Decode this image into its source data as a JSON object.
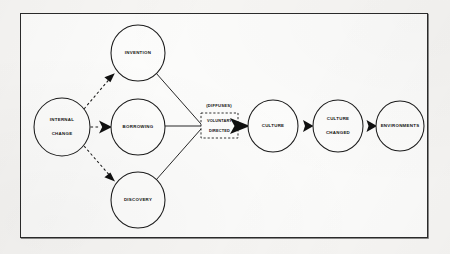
{
  "diagram": {
    "frame": {
      "border_color": "#2b2b2b",
      "background": "#fcfcfb"
    },
    "page_background": "#f7f6f4",
    "nodes": [
      {
        "id": "internal-change",
        "label_line1": "INTERNAL",
        "label_line2": "CHANGE",
        "cx": 62,
        "cy": 127,
        "rx": 28,
        "ry": 29
      },
      {
        "id": "invention",
        "label_line1": "INVENTION",
        "label_line2": "",
        "cx": 138,
        "cy": 53,
        "rx": 27,
        "ry": 28
      },
      {
        "id": "borrowing",
        "label_line1": "BORROWING",
        "label_line2": "",
        "cx": 138,
        "cy": 127,
        "rx": 27,
        "ry": 28
      },
      {
        "id": "discovery",
        "label_line1": "DISCOVERY",
        "label_line2": "",
        "cx": 138,
        "cy": 200,
        "rx": 27,
        "ry": 28
      },
      {
        "id": "culture",
        "label_line1": "CULTURE",
        "label_line2": "",
        "cx": 273,
        "cy": 126,
        "rx": 25,
        "ry": 26
      },
      {
        "id": "culture-changed",
        "label_line1": "CULTURE",
        "label_line2": "CHANGED",
        "cx": 338,
        "cy": 126,
        "rx": 25,
        "ry": 26
      },
      {
        "id": "environments",
        "label_line1": "ENVIRONMENTS",
        "label_line2": "",
        "cx": 400,
        "cy": 126,
        "rx": 24,
        "ry": 25
      }
    ],
    "dashed_box": {
      "id": "voluntary-directed",
      "label_line1": "VOLUNTARY",
      "label_line2": "DIRECTED",
      "x": 201,
      "y": 113,
      "width": 37,
      "height": 25
    },
    "caption": {
      "id": "diffuses-caption",
      "text": "(DIFFUSES)",
      "x": 219,
      "y": 106
    },
    "edges": [
      {
        "id": "internal-to-invention",
        "style": "dashed",
        "from": "internal-change",
        "to": "invention",
        "arrow": true
      },
      {
        "id": "internal-to-borrowing",
        "style": "dashed",
        "from": "internal-change",
        "to": "borrowing",
        "arrow": true
      },
      {
        "id": "internal-to-discovery",
        "style": "dashed",
        "from": "internal-change",
        "to": "discovery",
        "arrow": true
      },
      {
        "id": "invention-to-box",
        "style": "solid",
        "from": "invention",
        "to": "voluntary-directed",
        "arrow": false
      },
      {
        "id": "borrowing-to-box",
        "style": "solid",
        "from": "borrowing",
        "to": "voluntary-directed",
        "arrow": false
      },
      {
        "id": "discovery-to-box",
        "style": "solid",
        "from": "discovery",
        "to": "voluntary-directed",
        "arrow": false
      },
      {
        "id": "box-to-culture",
        "style": "solid",
        "from": "voluntary-directed",
        "to": "culture",
        "arrow": true
      },
      {
        "id": "culture-to-culture-changed",
        "style": "solid",
        "from": "culture",
        "to": "culture-changed",
        "arrow": true
      },
      {
        "id": "culture-changed-to-environments",
        "style": "solid",
        "from": "culture-changed",
        "to": "environments",
        "arrow": true
      }
    ]
  }
}
